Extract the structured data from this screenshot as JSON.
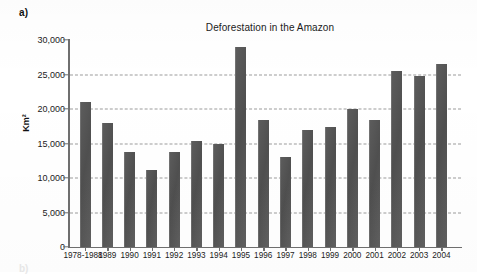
{
  "figure": {
    "panel_label": "a)",
    "next_panel_label": "b)"
  },
  "chart_data": {
    "type": "bar",
    "title": "Deforestation in the Amazon",
    "xlabel": "",
    "ylabel": "Km²",
    "ylim": [
      0,
      30000
    ],
    "ytick_values": [
      0,
      5000,
      10000,
      15000,
      20000,
      25000,
      30000
    ],
    "ytick_labels": [
      "0",
      "5,000",
      "10,000",
      "15,000",
      "20,000",
      "25,000",
      "30,000"
    ],
    "grid": "horizontal-dashed",
    "legend": "none",
    "bar_color": "#585858",
    "categories": [
      "1978-1988",
      "1989",
      "1990",
      "1991",
      "1992",
      "1993",
      "1994",
      "1995",
      "1996",
      "1997",
      "1998",
      "1999",
      "2000",
      "2001",
      "2002",
      "2003",
      "2004"
    ],
    "values": [
      21050,
      17950,
      13800,
      11100,
      13800,
      15300,
      14900,
      29050,
      18350,
      13000,
      17000,
      17400,
      19950,
      18400,
      25500,
      24800,
      26500
    ]
  }
}
